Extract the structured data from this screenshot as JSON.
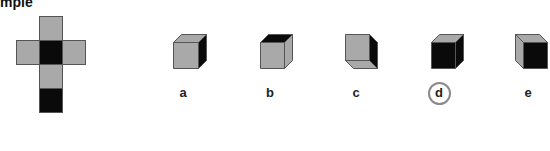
{
  "heading": "mple",
  "colors": {
    "gray": "#a9a9a9",
    "black": "#0a0a0a",
    "stroke": "#555555",
    "circle": "#8a8a8a"
  },
  "net": {
    "description": "Cross-shaped cube net: top gray, middle row gray-black-gray, below gray, bottom black",
    "faces": [
      {
        "row": 0,
        "col": 1,
        "color": "gray"
      },
      {
        "row": 1,
        "col": 0,
        "color": "gray"
      },
      {
        "row": 1,
        "col": 1,
        "color": "black"
      },
      {
        "row": 1,
        "col": 2,
        "color": "gray"
      },
      {
        "row": 2,
        "col": 1,
        "color": "gray"
      },
      {
        "row": 3,
        "col": 1,
        "color": "black"
      }
    ]
  },
  "options": [
    {
      "label": "a",
      "front": "gray",
      "top": "gray",
      "side": "black",
      "view": "top-right",
      "selected": false
    },
    {
      "label": "b",
      "front": "gray",
      "top": "black",
      "side": "gray",
      "view": "top-right",
      "selected": false
    },
    {
      "label": "c",
      "front": "gray",
      "bottom": "gray",
      "side": "black",
      "view": "bottom-right",
      "selected": false
    },
    {
      "label": "d",
      "front": "black",
      "top": "gray",
      "side": "black",
      "view": "top-right",
      "selected": true
    },
    {
      "label": "e",
      "front": "black",
      "top": "gray",
      "side": "gray",
      "view": "top-left",
      "selected": false
    }
  ]
}
